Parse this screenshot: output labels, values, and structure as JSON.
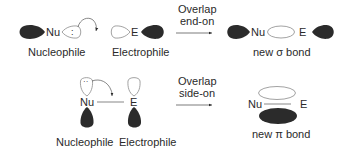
{
  "colors": {
    "filled_lobe": "#2b2b2b",
    "outline": "#8a8a8a",
    "text": "#2a2a2a",
    "background": "#ffffff"
  },
  "row_end_on": {
    "nucleophile": {
      "atom": "Nu",
      "lone_pair": ":",
      "label": "Nucleophile"
    },
    "electrophile": {
      "atom": "E",
      "label": "Electrophile"
    },
    "arrow": {
      "line1": "Overlap",
      "line2": "end-on"
    },
    "product": {
      "atom_left": "Nu",
      "atom_right": "E",
      "label": "new σ bond"
    }
  },
  "row_side_on": {
    "nucleophile": {
      "atom": "Nu",
      "lone_pair": "··",
      "label": "Nucleophile"
    },
    "electrophile": {
      "atom": "E",
      "label": "Electrophile"
    },
    "arrow": {
      "line1": "Overlap",
      "line2": "side-on"
    },
    "product": {
      "atom_left": "Nu",
      "atom_right": "E",
      "label": "new π bond"
    }
  }
}
